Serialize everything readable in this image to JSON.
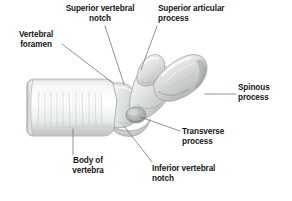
{
  "figure": {
    "subject": "vertebra",
    "view": "lateral",
    "background_color": "#ffffff",
    "text_color": "#171717",
    "leader_line_color": "#6e6e78",
    "bone_colors": {
      "highlight": "#fbfbfb",
      "base": "#e9eaea",
      "mid": "#d5d7d7",
      "shadow": "#b3b6b6",
      "deep_shadow": "#8e9292",
      "outline": "#9ea2a2"
    }
  },
  "labels": [
    {
      "id": "superior-vertebral-notch",
      "text": "Superior vertebral\nnotch",
      "align": "center",
      "x": 52,
      "y": 4,
      "width": 96
    },
    {
      "id": "superior-articular-process",
      "text": "Superior articular\nprocess",
      "align": "left",
      "x": 158,
      "y": 4,
      "width": 96
    },
    {
      "id": "vertebral-foramen",
      "text": "Vertebral\nforamen",
      "align": "center",
      "x": 4,
      "y": 30,
      "width": 64
    },
    {
      "id": "spinous-process",
      "text": "Spinous\nprocess",
      "align": "left",
      "x": 238,
      "y": 83,
      "width": 54
    },
    {
      "id": "transverse-process",
      "text": "Transverse\nprocess",
      "align": "left",
      "x": 182,
      "y": 127,
      "width": 66
    },
    {
      "id": "body-of-vertebra",
      "text": "Body of\nvertebra",
      "align": "center",
      "x": 48,
      "y": 156,
      "width": 80
    },
    {
      "id": "inferior-vertebral-notch",
      "text": "Inferior vertebral\nnotch",
      "align": "left",
      "x": 152,
      "y": 164,
      "width": 96
    }
  ],
  "leader_lines": [
    {
      "id": "leader-superior-vertebral-notch",
      "x1": 105,
      "y1": 26,
      "x2": 124,
      "y2": 84
    },
    {
      "id": "leader-superior-articular-process",
      "x1": 157,
      "y1": 26,
      "x2": 141,
      "y2": 70
    },
    {
      "id": "leader-vertebral-foramen",
      "x1": 62,
      "y1": 44,
      "x2": 113,
      "y2": 83
    },
    {
      "id": "leader-spinous-process",
      "x1": 236,
      "y1": 94,
      "x2": 205,
      "y2": 94
    },
    {
      "id": "leader-transverse-process",
      "x1": 180,
      "y1": 131,
      "x2": 140,
      "y2": 117
    },
    {
      "id": "leader-body-of-vertebra",
      "x1": 73,
      "y1": 155,
      "x2": 73,
      "y2": 129
    },
    {
      "id": "leader-inferior-vertebral-notch",
      "x1": 152,
      "y1": 162,
      "x2": 124,
      "y2": 126
    }
  ],
  "anatomy_parts": [
    {
      "id": "body-of-vertebra",
      "label": "Body of vertebra"
    },
    {
      "id": "vertebral-foramen",
      "label": "Vertebral foramen"
    },
    {
      "id": "superior-vertebral-notch",
      "label": "Superior vertebral notch"
    },
    {
      "id": "superior-articular-process",
      "label": "Superior articular process"
    },
    {
      "id": "spinous-process",
      "label": "Spinous process"
    },
    {
      "id": "transverse-process",
      "label": "Transverse process"
    },
    {
      "id": "inferior-vertebral-notch",
      "label": "Inferior vertebral notch"
    }
  ]
}
